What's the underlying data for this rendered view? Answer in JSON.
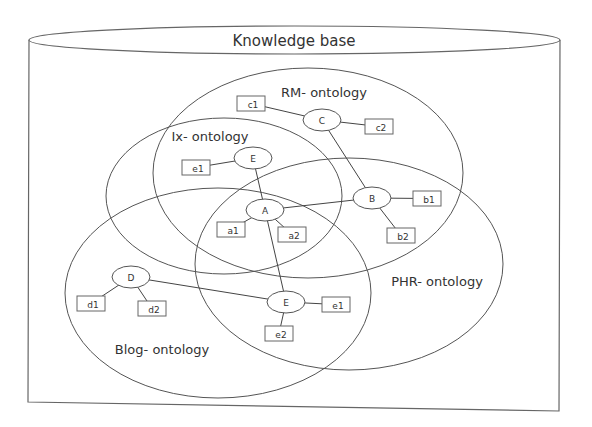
{
  "diagram": {
    "title": "Knowledge base",
    "colors": {
      "stroke": "#555555",
      "text": "#333333",
      "background": "#ffffff"
    },
    "ontologies": [
      {
        "id": "rm",
        "label": "RM- ontology",
        "cx": 308,
        "cy": 173,
        "rx": 155,
        "ry": 105,
        "label_x": 324,
        "label_y": 97
      },
      {
        "id": "ix",
        "label": "Ix- ontology",
        "cx": 224,
        "cy": 196,
        "rx": 118,
        "ry": 78,
        "label_x": 210,
        "label_y": 141
      },
      {
        "id": "phr",
        "label": "PHR- ontology",
        "cx": 349,
        "cy": 264,
        "rx": 154,
        "ry": 106,
        "label_x": 437,
        "label_y": 286
      },
      {
        "id": "blog",
        "label": "Blog- ontology",
        "cx": 218,
        "cy": 293,
        "rx": 153,
        "ry": 105,
        "label_x": 162,
        "label_y": 354
      }
    ],
    "concepts": [
      {
        "id": "C",
        "label": "C",
        "cx": 322,
        "cy": 120
      },
      {
        "id": "E1",
        "label": "E",
        "cx": 253,
        "cy": 158
      },
      {
        "id": "A",
        "label": "A",
        "cx": 265,
        "cy": 210
      },
      {
        "id": "B",
        "label": "B",
        "cx": 372,
        "cy": 198
      },
      {
        "id": "D",
        "label": "D",
        "cx": 131,
        "cy": 277
      },
      {
        "id": "E2",
        "label": "E",
        "cx": 286,
        "cy": 302
      }
    ],
    "properties": [
      {
        "id": "c1",
        "label": "c1",
        "x": 237,
        "y": 96,
        "parent": "C"
      },
      {
        "id": "c2",
        "label": "c2",
        "x": 365,
        "y": 119,
        "parent": "C"
      },
      {
        "id": "e1a",
        "label": "e1",
        "x": 182,
        "y": 160,
        "parent": "E1"
      },
      {
        "id": "a1",
        "label": "a1",
        "x": 217,
        "y": 222,
        "parent": "A"
      },
      {
        "id": "a2",
        "label": "a2",
        "x": 278,
        "y": 227,
        "parent": "A"
      },
      {
        "id": "b1",
        "label": "b1",
        "x": 413,
        "y": 191,
        "parent": "B"
      },
      {
        "id": "b2",
        "label": "b2",
        "x": 387,
        "y": 228,
        "parent": "B"
      },
      {
        "id": "d1",
        "label": "d1",
        "x": 77,
        "y": 296,
        "parent": "D"
      },
      {
        "id": "d2",
        "label": "d2",
        "x": 138,
        "y": 301,
        "parent": "D"
      },
      {
        "id": "e1b",
        "label": "e1",
        "x": 322,
        "y": 297,
        "parent": "E2"
      },
      {
        "id": "e2",
        "label": "e2",
        "x": 265,
        "y": 326,
        "parent": "E2"
      }
    ],
    "links": [
      [
        "C",
        "B"
      ],
      [
        "E1",
        "A"
      ],
      [
        "A",
        "B"
      ],
      [
        "A",
        "E2"
      ],
      [
        "D",
        "E2"
      ]
    ]
  }
}
